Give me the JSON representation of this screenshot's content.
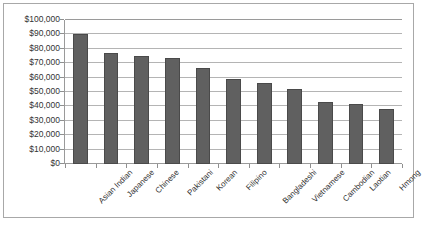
{
  "chart_data": {
    "type": "bar",
    "title": "",
    "xlabel": "",
    "ylabel": "",
    "ylim": [
      0,
      100000
    ],
    "ytick_step": 10000,
    "grid": true,
    "legend": "none",
    "bar_color": "#606060",
    "bar_border_color": "#4a4a4a",
    "gridline_color": "#b4b4b4",
    "axis_color": "#9a9a9a",
    "categories": [
      "Asian Indian",
      "Japanese",
      "Chinese",
      "Pakistani",
      "Korean",
      "Filipino",
      "Bangladeshi",
      "Vietnamese",
      "Cambodian",
      "Laotian",
      "Hmong"
    ],
    "values": [
      90000,
      77000,
      75000,
      73500,
      67000,
      59000,
      56000,
      52000,
      43000,
      42000,
      38000
    ],
    "ytick_labels": [
      "$100,000",
      "$90,000",
      "$80,000",
      "$70,000",
      "$60,000",
      "$50,000",
      "$40,000",
      "$30,000",
      "$20,000",
      "$10,000",
      "$0"
    ],
    "ytick_values": [
      100000,
      90000,
      80000,
      70000,
      60000,
      50000,
      40000,
      30000,
      20000,
      10000,
      0
    ]
  }
}
